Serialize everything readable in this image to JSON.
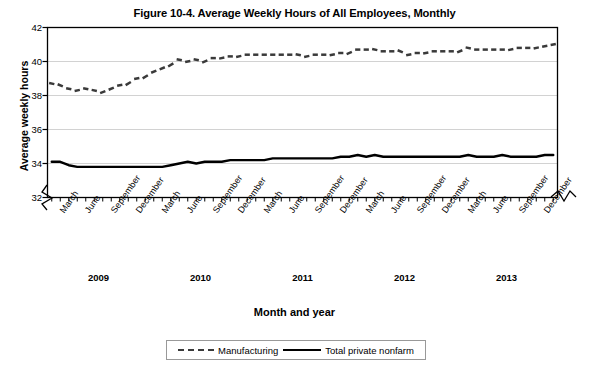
{
  "figure": {
    "title": "Figure 10-4. Average Weekly Hours of All Employees, Monthly",
    "x_axis_title": "Month and year",
    "y_axis_title": "Average weekly hours"
  },
  "legend": {
    "position": "bottom-center",
    "entries": [
      {
        "label": "Manufacturing",
        "style": "dashed",
        "color": "#3a3a3a"
      },
      {
        "label": "Total private nonfarm",
        "style": "solid",
        "color": "#000000"
      }
    ]
  },
  "axis": {
    "y_ticks": [
      "32",
      "34",
      "36",
      "38",
      "40",
      "42"
    ],
    "y_break_below": "32",
    "x_break_at_end": true,
    "month_tick_labels": [
      "March",
      "June",
      "September",
      "December",
      "March",
      "June",
      "September",
      "December",
      "March",
      "June",
      "September",
      "December",
      "March",
      "June",
      "September",
      "December",
      "March",
      "June",
      "September",
      "December"
    ],
    "year_labels": [
      "2009",
      "2010",
      "2011",
      "2012",
      "2013"
    ]
  },
  "chart_data": {
    "type": "line",
    "title": "Figure 10-4. Average Weekly Hours of All Employees, Monthly",
    "xlabel": "Month and year",
    "ylabel": "Average weekly hours",
    "ylim": [
      32,
      42
    ],
    "yticks": [
      32,
      34,
      36,
      38,
      40,
      42
    ],
    "grid": true,
    "legend_position": "bottom-center",
    "x": [
      "2009-01",
      "2009-02",
      "2009-03",
      "2009-04",
      "2009-05",
      "2009-06",
      "2009-07",
      "2009-08",
      "2009-09",
      "2009-10",
      "2009-11",
      "2009-12",
      "2010-01",
      "2010-02",
      "2010-03",
      "2010-04",
      "2010-05",
      "2010-06",
      "2010-07",
      "2010-08",
      "2010-09",
      "2010-10",
      "2010-11",
      "2010-12",
      "2011-01",
      "2011-02",
      "2011-03",
      "2011-04",
      "2011-05",
      "2011-06",
      "2011-07",
      "2011-08",
      "2011-09",
      "2011-10",
      "2011-11",
      "2011-12",
      "2012-01",
      "2012-02",
      "2012-03",
      "2012-04",
      "2012-05",
      "2012-06",
      "2012-07",
      "2012-08",
      "2012-09",
      "2012-10",
      "2012-11",
      "2012-12",
      "2013-01",
      "2013-02",
      "2013-03",
      "2013-04",
      "2013-05",
      "2013-06",
      "2013-07",
      "2013-08",
      "2013-09",
      "2013-10",
      "2013-11",
      "2013-12"
    ],
    "series": [
      {
        "name": "Manufacturing",
        "style": "dashed",
        "color": "#3a3a3a",
        "values": [
          38.7,
          38.6,
          38.4,
          38.3,
          38.4,
          38.3,
          38.2,
          38.4,
          38.6,
          38.7,
          39.0,
          39.1,
          39.4,
          39.6,
          39.8,
          40.1,
          40.0,
          40.1,
          40.0,
          40.2,
          40.2,
          40.3,
          40.3,
          40.4,
          40.4,
          40.4,
          40.4,
          40.4,
          40.4,
          40.4,
          40.3,
          40.4,
          40.4,
          40.4,
          40.5,
          40.5,
          40.7,
          40.7,
          40.7,
          40.6,
          40.6,
          40.6,
          40.4,
          40.5,
          40.5,
          40.6,
          40.6,
          40.6,
          40.6,
          40.8,
          40.7,
          40.7,
          40.7,
          40.7,
          40.7,
          40.8,
          40.8,
          40.8,
          40.9,
          41.0
        ]
      },
      {
        "name": "Total private nonfarm",
        "style": "solid",
        "color": "#000000",
        "values": [
          34.1,
          34.1,
          33.9,
          33.8,
          33.8,
          33.8,
          33.8,
          33.8,
          33.8,
          33.8,
          33.8,
          33.8,
          33.8,
          33.8,
          33.9,
          34.0,
          34.1,
          34.0,
          34.1,
          34.1,
          34.1,
          34.2,
          34.2,
          34.2,
          34.2,
          34.2,
          34.3,
          34.3,
          34.3,
          34.3,
          34.3,
          34.3,
          34.3,
          34.3,
          34.4,
          34.4,
          34.5,
          34.4,
          34.5,
          34.4,
          34.4,
          34.4,
          34.4,
          34.4,
          34.4,
          34.4,
          34.4,
          34.4,
          34.4,
          34.5,
          34.4,
          34.4,
          34.4,
          34.5,
          34.4,
          34.4,
          34.4,
          34.4,
          34.5,
          34.5
        ]
      }
    ]
  }
}
